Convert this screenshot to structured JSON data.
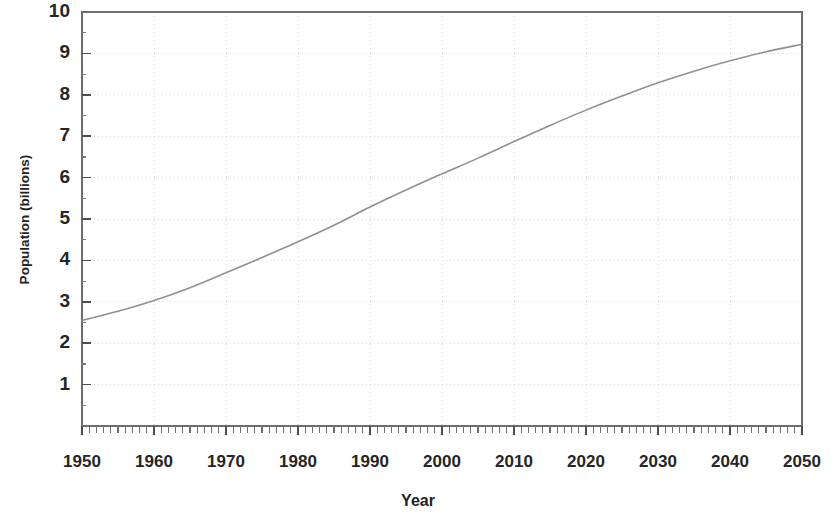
{
  "figure": {
    "name": "world-population-projection-chart",
    "background_color": "#ffffff",
    "line_color": "#8a8a8a",
    "axis_color": "#6e6e6e",
    "grid_color": "#d8d8d8",
    "text_color": "#262626"
  },
  "chart_data": {
    "type": "line",
    "title": "",
    "subtitle": "",
    "xlabel": "Year",
    "ylabel": "Population (billions)",
    "xlim": [
      1950,
      2050
    ],
    "ylim": [
      0,
      10
    ],
    "x_ticks": [
      1950,
      1960,
      1970,
      1980,
      1990,
      2000,
      2010,
      2020,
      2030,
      2040,
      2050
    ],
    "x_tick_labels": [
      "1950",
      "1960",
      "1970",
      "1980",
      "1990",
      "2000",
      "2010",
      "2020",
      "2030",
      "2040",
      "2050"
    ],
    "x_minor_tick_interval": 1,
    "y_ticks": [
      1,
      2,
      3,
      4,
      5,
      6,
      7,
      8,
      9,
      10
    ],
    "y_tick_labels": [
      "1",
      "2",
      "3",
      "4",
      "5",
      "6",
      "7",
      "8",
      "9",
      "10"
    ],
    "y_minor_tick_interval": 0.5,
    "grid": "dotted-major-both",
    "legend": "none",
    "annotations": [],
    "series": [
      {
        "name": "World population",
        "color": "#8a8a8a",
        "line_width": 1.6,
        "x": [
          1950,
          1955,
          1960,
          1965,
          1970,
          1975,
          1980,
          1985,
          1990,
          1995,
          2000,
          2005,
          2010,
          2015,
          2020,
          2025,
          2030,
          2035,
          2040,
          2045,
          2050
        ],
        "values": [
          2.55,
          2.77,
          3.03,
          3.34,
          3.7,
          4.07,
          4.45,
          4.85,
          5.29,
          5.7,
          6.09,
          6.47,
          6.87,
          7.26,
          7.63,
          7.97,
          8.29,
          8.57,
          8.82,
          9.04,
          9.22
        ]
      }
    ]
  }
}
